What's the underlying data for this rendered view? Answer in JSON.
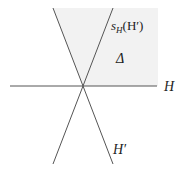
{
  "diagram": {
    "type": "hyperplane-chamber",
    "colors": {
      "line": "#555555",
      "chamber_fill": "#f2f2f2",
      "text": "#222222",
      "background": "#ffffff"
    },
    "labels": {
      "reflected_hyperplane_base": "s",
      "reflected_hyperplane_sub": "H",
      "reflected_hyperplane_arg": "(H′)",
      "chamber": "Δ",
      "horizontal_hyperplane": "H",
      "hyperplane_prime": "H′"
    },
    "elements": [
      {
        "name": "hyperplane-H",
        "description": "horizontal line"
      },
      {
        "name": "hyperplane-H-prime",
        "description": "line from upper-left to lower-right"
      },
      {
        "name": "hyperplane-sH-H-prime",
        "description": "reflection of H′ across H, from upper-right to lower-left"
      },
      {
        "name": "chamber-delta",
        "description": "shaded region above H, right of H′"
      }
    ]
  }
}
